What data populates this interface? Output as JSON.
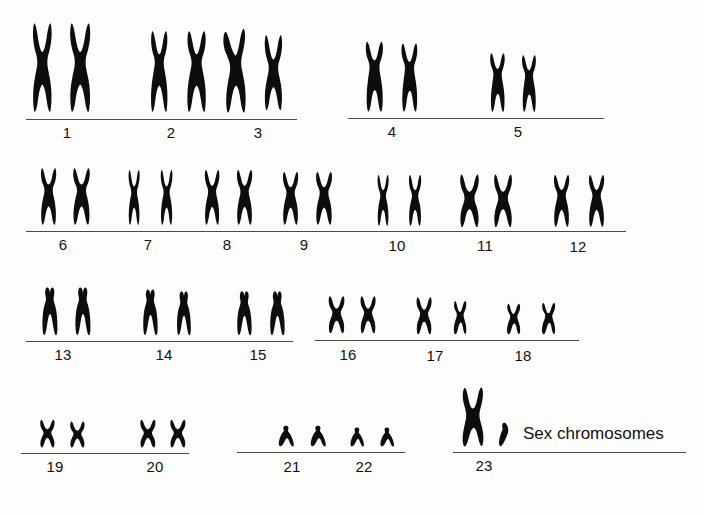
{
  "figure": {
    "ink_color": "#0d0d0d",
    "rule_color": "#4a4a4a",
    "background_color": "#fdfdfc",
    "total_pairs": 23,
    "sex_caption": "Sex chromosomes"
  },
  "rows": [
    {
      "row_index": 1,
      "groups": [
        {
          "label": "1",
          "pair_count": 2,
          "chromosomes": [
            {
              "shape": "metacentric-large",
              "height": 92,
              "width": 28
            },
            {
              "shape": "metacentric-large",
              "height": 92,
              "width": 30
            }
          ]
        },
        {
          "label": "2",
          "pair_count": 2,
          "chromosomes": [
            {
              "shape": "submetacentric-large",
              "height": 84,
              "width": 25
            },
            {
              "shape": "submetacentric-large",
              "height": 84,
              "width": 28
            }
          ]
        },
        {
          "label": "3",
          "pair_count": 2,
          "chromosomes": [
            {
              "shape": "metacentric-large-bent",
              "height": 86,
              "width": 30
            },
            {
              "shape": "metacentric-large",
              "height": 78,
              "width": 26
            }
          ]
        },
        {
          "label": "4",
          "pair_count": 2,
          "chromosomes": [
            {
              "shape": "submetacentric-medium",
              "height": 74,
              "width": 26
            },
            {
              "shape": "submetacentric-medium",
              "height": 72,
              "width": 24
            }
          ]
        },
        {
          "label": "5",
          "pair_count": 2,
          "chromosomes": [
            {
              "shape": "submetacentric-medium",
              "height": 62,
              "width": 22
            },
            {
              "shape": "submetacentric-medium",
              "height": 60,
              "width": 21
            }
          ]
        }
      ]
    },
    {
      "row_index": 2,
      "groups": [
        {
          "label": "6",
          "pair_count": 2,
          "chromosomes": [
            {
              "shape": "submetacentric",
              "height": 60,
              "width": 23
            },
            {
              "shape": "submetacentric",
              "height": 60,
              "width": 25
            }
          ]
        },
        {
          "label": "7",
          "pair_count": 2,
          "chromosomes": [
            {
              "shape": "submetacentric-slim",
              "height": 58,
              "width": 19
            },
            {
              "shape": "submetacentric-slim",
              "height": 58,
              "width": 20
            }
          ]
        },
        {
          "label": "8",
          "pair_count": 2,
          "chromosomes": [
            {
              "shape": "submetacentric",
              "height": 58,
              "width": 22
            },
            {
              "shape": "submetacentric",
              "height": 58,
              "width": 23
            }
          ]
        },
        {
          "label": "9",
          "pair_count": 2,
          "chromosomes": [
            {
              "shape": "submetacentric",
              "height": 56,
              "width": 23
            },
            {
              "shape": "submetacentric",
              "height": 56,
              "width": 24
            }
          ]
        },
        {
          "label": "10",
          "pair_count": 2,
          "chromosomes": [
            {
              "shape": "submetacentric-slim",
              "height": 54,
              "width": 19
            },
            {
              "shape": "submetacentric-slim",
              "height": 54,
              "width": 21
            }
          ]
        },
        {
          "label": "11",
          "pair_count": 2,
          "chromosomes": [
            {
              "shape": "metacentric",
              "height": 55,
              "width": 25
            },
            {
              "shape": "metacentric",
              "height": 55,
              "width": 24
            }
          ]
        },
        {
          "label": "12",
          "pair_count": 2,
          "chromosomes": [
            {
              "shape": "submetacentric",
              "height": 55,
              "width": 23
            },
            {
              "shape": "submetacentric",
              "height": 55,
              "width": 23
            }
          ]
        }
      ]
    },
    {
      "row_index": 3,
      "groups": [
        {
          "label": "13",
          "pair_count": 2,
          "chromosomes": [
            {
              "shape": "acrocentric-large",
              "height": 50,
              "width": 24
            },
            {
              "shape": "acrocentric-large",
              "height": 50,
              "width": 24
            }
          ]
        },
        {
          "label": "14",
          "pair_count": 2,
          "chromosomes": [
            {
              "shape": "acrocentric-large",
              "height": 48,
              "width": 23
            },
            {
              "shape": "acrocentric-large",
              "height": 46,
              "width": 22
            }
          ]
        },
        {
          "label": "15",
          "pair_count": 2,
          "chromosomes": [
            {
              "shape": "acrocentric-large",
              "height": 46,
              "width": 23
            },
            {
              "shape": "acrocentric-large",
              "height": 46,
              "width": 23
            }
          ]
        },
        {
          "label": "16",
          "pair_count": 2,
          "chromosomes": [
            {
              "shape": "metacentric-small",
              "height": 40,
              "width": 22
            },
            {
              "shape": "metacentric-small",
              "height": 40,
              "width": 21
            }
          ]
        },
        {
          "label": "17",
          "pair_count": 2,
          "chromosomes": [
            {
              "shape": "metacentric-small",
              "height": 40,
              "width": 21
            },
            {
              "shape": "submetacentric-small",
              "height": 36,
              "width": 20
            }
          ]
        },
        {
          "label": "18",
          "pair_count": 2,
          "chromosomes": [
            {
              "shape": "submetacentric-small",
              "height": 33,
              "width": 21
            },
            {
              "shape": "submetacentric-small",
              "height": 34,
              "width": 21
            }
          ]
        }
      ]
    },
    {
      "row_index": 4,
      "groups": [
        {
          "label": "19",
          "pair_count": 2,
          "chromosomes": [
            {
              "shape": "metacentric-tiny",
              "height": 30,
              "width": 19
            },
            {
              "shape": "metacentric-tiny",
              "height": 28,
              "width": 19
            }
          ]
        },
        {
          "label": "20",
          "pair_count": 2,
          "chromosomes": [
            {
              "shape": "metacentric-tiny",
              "height": 30,
              "width": 20
            },
            {
              "shape": "metacentric-tiny",
              "height": 30,
              "width": 20
            }
          ]
        },
        {
          "label": "21",
          "pair_count": 2,
          "chromosomes": [
            {
              "shape": "acrocentric-tiny",
              "height": 22,
              "width": 20
            },
            {
              "shape": "acrocentric-tiny",
              "height": 22,
              "width": 20
            }
          ]
        },
        {
          "label": "22",
          "pair_count": 2,
          "chromosomes": [
            {
              "shape": "acrocentric-tiny",
              "height": 20,
              "width": 18
            },
            {
              "shape": "acrocentric-tiny",
              "height": 20,
              "width": 18
            }
          ]
        },
        {
          "label": "23",
          "pair_count": 2,
          "chromosomes": [
            {
              "shape": "x-chromosome",
              "height": 60,
              "width": 27
            },
            {
              "shape": "y-chromosome",
              "height": 25,
              "width": 16
            }
          ]
        }
      ]
    }
  ],
  "rules": [
    {
      "group_span": "1-3",
      "x": 26,
      "y": 119,
      "width": 271
    },
    {
      "group_span": "4-5",
      "x": 348,
      "y": 118,
      "width": 256
    },
    {
      "group_span": "6-12",
      "x": 26,
      "y": 231,
      "width": 600
    },
    {
      "group_span": "13-15",
      "x": 26,
      "y": 341,
      "width": 267
    },
    {
      "group_span": "16-18",
      "x": 315,
      "y": 340,
      "width": 264
    },
    {
      "group_span": "19-20",
      "x": 21,
      "y": 453,
      "width": 168
    },
    {
      "group_span": "21-22",
      "x": 237,
      "y": 452,
      "width": 168
    },
    {
      "group_span": "23",
      "x": 453,
      "y": 452,
      "width": 233
    }
  ],
  "labels": [
    {
      "text": "1",
      "cx": 67,
      "y": 124
    },
    {
      "text": "2",
      "cx": 171,
      "y": 124
    },
    {
      "text": "3",
      "cx": 258,
      "y": 124
    },
    {
      "text": "4",
      "cx": 392,
      "y": 123
    },
    {
      "text": "5",
      "cx": 518,
      "y": 123
    },
    {
      "text": "6",
      "cx": 63,
      "y": 236
    },
    {
      "text": "7",
      "cx": 148,
      "y": 236
    },
    {
      "text": "8",
      "cx": 227,
      "y": 236
    },
    {
      "text": "9",
      "cx": 304,
      "y": 236
    },
    {
      "text": "10",
      "cx": 397,
      "y": 237
    },
    {
      "text": "11",
      "cx": 485,
      "y": 237
    },
    {
      "text": "12",
      "cx": 578,
      "y": 238
    },
    {
      "text": "13",
      "cx": 63,
      "y": 346
    },
    {
      "text": "14",
      "cx": 164,
      "y": 346
    },
    {
      "text": "15",
      "cx": 258,
      "y": 346
    },
    {
      "text": "16",
      "cx": 348,
      "y": 346
    },
    {
      "text": "17",
      "cx": 435,
      "y": 347
    },
    {
      "text": "18",
      "cx": 523,
      "y": 347
    },
    {
      "text": "19",
      "cx": 55,
      "y": 458
    },
    {
      "text": "20",
      "cx": 155,
      "y": 458
    },
    {
      "text": "21",
      "cx": 292,
      "y": 458
    },
    {
      "text": "22",
      "cx": 364,
      "y": 458
    },
    {
      "text": "23",
      "cx": 484,
      "y": 457
    }
  ],
  "sex_label": {
    "text": "Sex chromosomes",
    "x": 523,
    "y": 424
  }
}
